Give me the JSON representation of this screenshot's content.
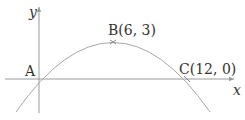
{
  "diagram": {
    "type": "parabola-graph",
    "axes": {
      "x_label": "x",
      "y_label": "y",
      "color": "#9a9a9a"
    },
    "curve": {
      "color": "#a8a8a8",
      "equation_form": "y = a x (12 - x)",
      "vertex": [
        6,
        3
      ],
      "roots": [
        0,
        12
      ]
    },
    "points": [
      {
        "id": "A",
        "label": "A",
        "coords": [
          0,
          0
        ]
      },
      {
        "id": "B",
        "label": "B(6, 3)",
        "coords": [
          6,
          3
        ]
      },
      {
        "id": "C",
        "label": "C(12, 0)",
        "coords": [
          12,
          0
        ]
      }
    ]
  }
}
